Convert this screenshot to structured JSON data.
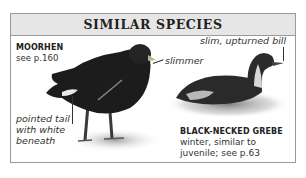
{
  "panel": {
    "title": "SIMILAR SPECIES"
  },
  "species": [
    {
      "name": "MOORHEN",
      "reference": "see p.160",
      "annotations": {
        "tail": [
          "pointed tail",
          "with white",
          "beneath"
        ],
        "body": "slimmer"
      }
    },
    {
      "name": "BLACK-NECKED GREBE",
      "description": [
        "winter, similar to",
        "juvenile; see p.63"
      ],
      "annotations": {
        "bill": "slim, upturned bill"
      }
    }
  ],
  "colors": {
    "header_bg": "#e6e6e6",
    "border": "#9a9a9a",
    "text": "#333333"
  }
}
